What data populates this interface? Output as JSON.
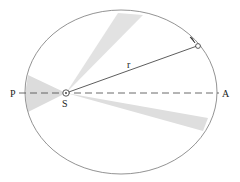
{
  "diagram": {
    "labels": {
      "perihelion": "P",
      "aphelion": "A",
      "sun": "S",
      "radius": "r"
    },
    "colors": {
      "orbit": "#777777",
      "line": "#333333",
      "sector": "#d9d9d9",
      "text": "#222222"
    },
    "elements": {
      "orbit": "ellipse",
      "sectors": 3,
      "axis": "dashed line P–A through S",
      "planet": "open circle with direction arrow"
    }
  }
}
